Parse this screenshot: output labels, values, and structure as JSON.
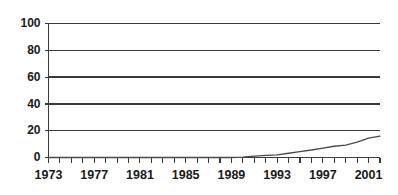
{
  "chart_data": {
    "type": "line",
    "title": "",
    "subtitle": "",
    "xlabel": "",
    "ylabel": "",
    "xlim": [
      1973,
      2002
    ],
    "ylim": [
      0,
      100
    ],
    "grid": true,
    "legend": "none",
    "y_ticks": [
      0,
      20,
      40,
      60,
      80,
      100
    ],
    "y_tick_labels": [
      "0",
      "20",
      "40",
      "60",
      "80",
      "100"
    ],
    "x_tick_values": [
      1973,
      1974,
      1975,
      1976,
      1977,
      1978,
      1979,
      1980,
      1981,
      1982,
      1983,
      1984,
      1985,
      1986,
      1987,
      1988,
      1989,
      1990,
      1991,
      1992,
      1993,
      1994,
      1995,
      1996,
      1997,
      1998,
      1999,
      2000,
      2001,
      2002
    ],
    "x_tick_labels": [
      "1973",
      "1977",
      "1981",
      "1985",
      "1989",
      "1993",
      "1997",
      "2001"
    ],
    "x_labelled_values": [
      1973,
      1977,
      1981,
      1985,
      1989,
      1993,
      1997,
      2001
    ],
    "x": [
      1973,
      1974,
      1975,
      1976,
      1977,
      1978,
      1979,
      1980,
      1981,
      1982,
      1983,
      1984,
      1985,
      1986,
      1987,
      1988,
      1989,
      1990,
      1991,
      1992,
      1993,
      1994,
      1995,
      1996,
      1997,
      1998,
      1999,
      2000,
      2001,
      2002
    ],
    "values": [
      0,
      0,
      0,
      0,
      0,
      0,
      0,
      0,
      0,
      0,
      0,
      0,
      0,
      0,
      0,
      0,
      0,
      0.3,
      1.0,
      1.6,
      2.0,
      3.2,
      4.4,
      5.6,
      7.0,
      8.4,
      9.2,
      11.4,
      14.4,
      16.0
    ],
    "series": [
      {
        "name": "series-1",
        "color": "#4a4a4a",
        "values": [
          0,
          0,
          0,
          0,
          0,
          0,
          0,
          0,
          0,
          0,
          0,
          0,
          0,
          0,
          0,
          0,
          0,
          0.3,
          1.0,
          1.6,
          2.0,
          3.2,
          4.4,
          5.6,
          7.0,
          8.4,
          9.2,
          11.4,
          14.4,
          16.0
        ]
      }
    ],
    "colors": {
      "line": "#4a4a4a",
      "grid": "#3a3a3a",
      "axis": "#3a3a3a",
      "text": "#1a1a1a",
      "background": "#ffffff"
    }
  }
}
